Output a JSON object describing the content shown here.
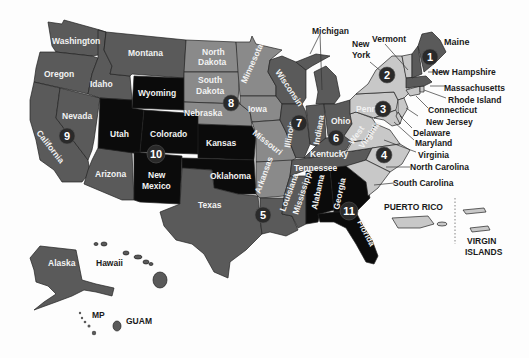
{
  "colors": {
    "background": "#fdfdfd",
    "dark_gray": "#5a5a5a",
    "medium_gray": "#8a8a8a",
    "light_gray": "#c8c8c8",
    "black": "#0b0b0b",
    "badge": "#2a2a2a"
  },
  "states": {
    "washington": "Washington",
    "oregon": "Oregon",
    "california": "California",
    "nevada": "Nevada",
    "idaho": "Idaho",
    "montana": "Montana",
    "wyoming": "Wyoming",
    "utah": "Utah",
    "colorado": "Colorado",
    "arizona": "Arizona",
    "new_mexico_1": "New",
    "new_mexico_2": "Mexico",
    "north_dakota_1": "North",
    "north_dakota_2": "Dakota",
    "south_dakota_1": "South",
    "south_dakota_2": "Dakota",
    "nebraska": "Nebraska",
    "kansas": "Kansas",
    "oklahoma": "Oklahoma",
    "texas": "Texas",
    "minnesota": "Minnesota",
    "iowa": "Iowa",
    "missouri": "Missouri",
    "arkansas": "Arkansas",
    "louisiana": "Louisiana",
    "wisconsin": "Wisconsin",
    "illinois": "Illinois",
    "michigan": "Michigan",
    "indiana": "Indiana",
    "ohio": "Ohio",
    "kentucky": "Kentucky",
    "tennessee": "Tennessee",
    "mississippi": "Mississippi",
    "alabama": "Alabama",
    "georgia": "Georgia",
    "florida": "Florida",
    "west_virginia_1": "West",
    "west_virginia_2": "Virginia",
    "pennsylvania": "Penn",
    "new_york_1": "New",
    "new_york_2": "York",
    "vermont": "Vermont",
    "maine": "Maine",
    "new_hampshire": "New Hampshire",
    "massachusetts": "Massachusetts",
    "rhode_island": "Rhode Island",
    "connecticut": "Connecticut",
    "new_jersey": "New Jersey",
    "delaware": "Delaware",
    "maryland": "Maryland",
    "virginia": "Virginia",
    "north_carolina": "North Carolina",
    "south_carolina": "South Carolina",
    "alaska": "Alaska",
    "hawaii": "Hawaii"
  },
  "territories": {
    "puerto_rico": "PUERTO RICO",
    "virgin_islands_1": "VIRGIN",
    "virgin_islands_2": "ISLANDS",
    "mp": "MP",
    "guam": "GUAM"
  },
  "regions": [
    {
      "number": "1",
      "area": "New England (Maine)"
    },
    {
      "number": "2",
      "area": "New York"
    },
    {
      "number": "3",
      "area": "Pennsylvania"
    },
    {
      "number": "4",
      "area": "Virginia"
    },
    {
      "number": "5",
      "area": "Louisiana"
    },
    {
      "number": "6",
      "area": "Ohio / Kentucky"
    },
    {
      "number": "7",
      "area": "Illinois"
    },
    {
      "number": "8",
      "area": "Nebraska / South Dakota"
    },
    {
      "number": "9",
      "area": "California / Nevada"
    },
    {
      "number": "10",
      "area": "Colorado / New Mexico"
    },
    {
      "number": "11",
      "area": "Georgia / Florida"
    }
  ]
}
